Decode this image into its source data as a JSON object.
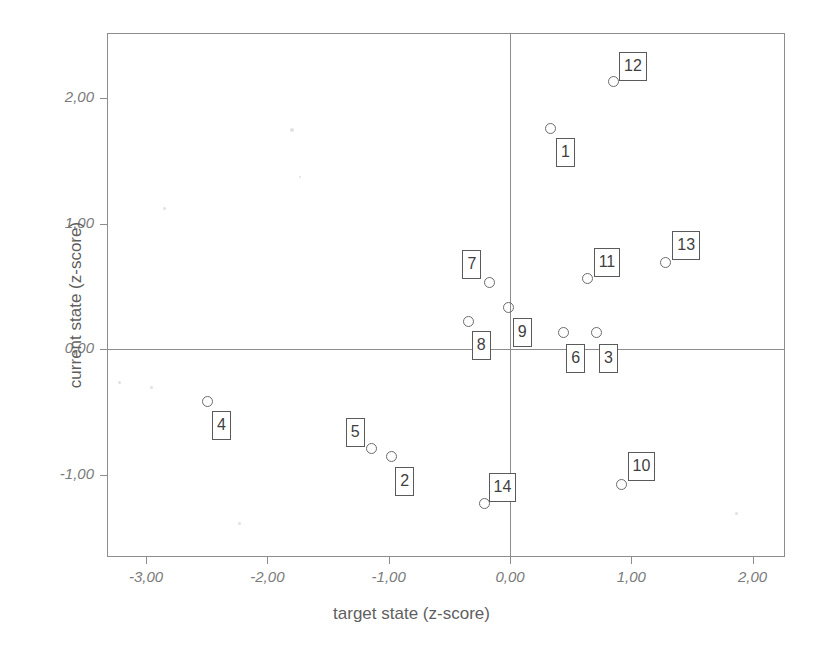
{
  "chart_data": {
    "type": "scatter",
    "title": "",
    "xlabel": "target state (z-score)",
    "ylabel": "current state (z-score)",
    "xlim": [
      -3.33,
      2.26
    ],
    "ylim": [
      -1.52,
      2.52
    ],
    "grid": false,
    "legend": "none",
    "decimal_separator": ",",
    "xticks": [
      {
        "value": -3.0,
        "label": "-3,00"
      },
      {
        "value": -2.0,
        "label": "-2,00"
      },
      {
        "value": -1.0,
        "label": "-1,00"
      },
      {
        "value": 0.0,
        "label": "0,00"
      },
      {
        "value": 1.0,
        "label": "1,00"
      },
      {
        "value": 2.0,
        "label": "2,00"
      }
    ],
    "yticks": [
      {
        "value": 2.0,
        "label": "2,00"
      },
      {
        "value": 1.0,
        "label": "1,00"
      },
      {
        "value": 0.0,
        "label": "0,00"
      },
      {
        "value": -1.0,
        "label": "-1,00"
      }
    ],
    "reference_lines": [
      {
        "axis": "y",
        "value": 0.0
      },
      {
        "axis": "x",
        "value": 0.0
      }
    ],
    "points": [
      {
        "label": "1",
        "x": 0.33,
        "y": 1.76,
        "label_dx": 6,
        "label_dy": 10
      },
      {
        "label": "2",
        "x": -0.98,
        "y": -0.86,
        "label_dx": 4,
        "label_dy": 10
      },
      {
        "label": "3",
        "x": 0.71,
        "y": 0.13,
        "label_dx": 3,
        "label_dy": 11
      },
      {
        "label": "4",
        "x": -2.49,
        "y": -0.42,
        "label_dx": 4,
        "label_dy": 9
      },
      {
        "label": "5",
        "x": -1.14,
        "y": -0.79,
        "label_dx": -26,
        "label_dy": -30
      },
      {
        "label": "6",
        "x": 0.44,
        "y": 0.13,
        "label_dx": 3,
        "label_dy": 11
      },
      {
        "label": "7",
        "x": -0.17,
        "y": 0.53,
        "label_dx": -27,
        "label_dy": -32
      },
      {
        "label": "8",
        "x": -0.34,
        "y": 0.22,
        "label_dx": 3,
        "label_dy": 10
      },
      {
        "label": "9",
        "x": -0.01,
        "y": 0.33,
        "label_dx": 4,
        "label_dy": 10
      },
      {
        "label": "10",
        "x": 0.92,
        "y": -1.08,
        "label_dx": 6,
        "label_dy": -33
      },
      {
        "label": "11",
        "x": 0.64,
        "y": 0.56,
        "label_dx": 6,
        "label_dy": -31
      },
      {
        "label": "12",
        "x": 0.85,
        "y": 2.13,
        "label_dx": 6,
        "label_dy": -30
      },
      {
        "label": "13",
        "x": 1.28,
        "y": 0.69,
        "label_dx": 7,
        "label_dy": -31
      },
      {
        "label": "14",
        "x": -0.21,
        "y": -1.23,
        "label_dx": 4,
        "label_dy": -30
      }
    ]
  },
  "geometry": {
    "plot_left": 107,
    "plot_top": 33,
    "plot_width": 678,
    "plot_height": 524,
    "x_origin_px": 510,
    "y_origin_px": 349,
    "px_per_x_unit": 121.3,
    "px_per_y_unit": 125.5
  },
  "artifacts": [
    {
      "x": 290,
      "y": 128,
      "size": 4
    },
    {
      "x": 163,
      "y": 207,
      "size": 3
    },
    {
      "x": 118,
      "y": 381,
      "size": 3
    },
    {
      "x": 150,
      "y": 386,
      "size": 3
    },
    {
      "x": 238,
      "y": 522,
      "size": 3
    },
    {
      "x": 735,
      "y": 512,
      "size": 3
    },
    {
      "x": 299,
      "y": 176,
      "size": 2
    }
  ]
}
